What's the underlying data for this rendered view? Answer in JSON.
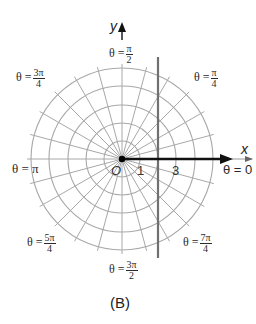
{
  "diagram": {
    "type": "polar-grid",
    "caption": "(B)",
    "center": [
      122,
      159
    ],
    "circle_radii_px": [
      18,
      36,
      54,
      73,
      91
    ],
    "radial_line_step_deg": 15,
    "grid_color": "#a8a8a8",
    "axis_color": "#111111",
    "vertical_line": {
      "x_value": 2,
      "color": "#707070"
    },
    "axes": {
      "x_label": "x",
      "y_label": "y"
    },
    "origin_label": "O",
    "ticks": [
      {
        "label": "1"
      },
      {
        "label": "3"
      }
    ],
    "angle_labels": {
      "theta_0": {
        "prefix": "θ = 0"
      },
      "theta_pi": {
        "prefix": "θ = π"
      },
      "theta_pi_2": {
        "prefix": "θ =",
        "num": "π",
        "den": "2"
      },
      "theta_pi_4": {
        "prefix": "θ =",
        "num": "π",
        "den": "4"
      },
      "theta_3pi_4": {
        "prefix": "θ =",
        "num": "3π",
        "den": "4"
      },
      "theta_5pi_4": {
        "prefix": "θ =",
        "num": "5π",
        "den": "4"
      },
      "theta_3pi_2": {
        "prefix": "θ =",
        "num": "3π",
        "den": "2"
      },
      "theta_7pi_4": {
        "prefix": "θ =",
        "num": "7π",
        "den": "4"
      }
    }
  }
}
